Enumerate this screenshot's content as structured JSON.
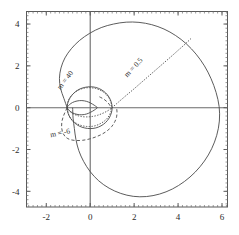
{
  "chart_data": {
    "type": "line",
    "title": "",
    "xlabel": "",
    "ylabel": "",
    "xlim": [
      -2.9,
      6.25
    ],
    "ylim": [
      -4.75,
      4.6
    ],
    "xticks": [
      -2,
      0,
      2,
      4,
      6
    ],
    "xticklabels": [
      "-2",
      "0",
      "2",
      "4",
      "6"
    ],
    "yticks": [
      4,
      2,
      0,
      -2,
      -4
    ],
    "yticklabels": [
      "4",
      "2",
      "0",
      "-2",
      "-4"
    ],
    "grid": false,
    "legend_position": "inline-annotations",
    "minor_ticks": true,
    "coordinate_system": "cartesian-render-of-polar-family",
    "annotations": [
      {
        "name": "label-m-40",
        "text": "m = 40",
        "x": -1.05,
        "y": 1.25,
        "rotation": -52,
        "linestyle": "dotted"
      },
      {
        "name": "label-m-05",
        "text": "m = 0.5",
        "x": 2.05,
        "y": 1.85,
        "rotation": -47,
        "linestyle": "dotted"
      },
      {
        "name": "label-m-neg6",
        "text": "m = -6",
        "x": -1.35,
        "y": -1.32,
        "rotation": -12,
        "linestyle": "dashed"
      }
    ],
    "series": [
      {
        "name": "outer-solid-curve",
        "linestyle": "solid",
        "description": "large limacon lobe reaching x=5.9 at y=0, top y=4.1, bottom y=-4.25, left cusp near x=-1.05",
        "points": [
          [
            -1.05,
            0.0
          ],
          [
            -1.2,
            0.45
          ],
          [
            -1.35,
            0.92
          ],
          [
            -1.4,
            1.4
          ],
          [
            -1.33,
            1.9
          ],
          [
            -1.15,
            2.38
          ],
          [
            -0.86,
            2.82
          ],
          [
            -0.48,
            3.22
          ],
          [
            -0.02,
            3.56
          ],
          [
            0.5,
            3.83
          ],
          [
            1.06,
            4.0
          ],
          [
            1.64,
            4.09
          ],
          [
            2.22,
            4.08
          ],
          [
            2.8,
            3.97
          ],
          [
            3.36,
            3.76
          ],
          [
            3.89,
            3.45
          ],
          [
            4.38,
            3.05
          ],
          [
            4.82,
            2.56
          ],
          [
            5.2,
            2.0
          ],
          [
            5.5,
            1.39
          ],
          [
            5.73,
            0.73
          ],
          [
            5.87,
            0.05
          ],
          [
            5.88,
            -0.64
          ],
          [
            5.76,
            -1.32
          ],
          [
            5.53,
            -1.96
          ],
          [
            5.2,
            -2.55
          ],
          [
            4.78,
            -3.08
          ],
          [
            4.29,
            -3.53
          ],
          [
            3.74,
            -3.89
          ],
          [
            3.16,
            -4.13
          ],
          [
            2.56,
            -4.25
          ],
          [
            1.96,
            -4.24
          ],
          [
            1.39,
            -4.1
          ],
          [
            0.86,
            -3.85
          ],
          [
            0.39,
            -3.5
          ],
          [
            0.0,
            -3.06
          ],
          [
            -0.3,
            -2.57
          ],
          [
            -0.52,
            -2.05
          ],
          [
            -0.65,
            -1.52
          ],
          [
            -0.72,
            -1.0
          ],
          [
            -0.78,
            -0.5
          ],
          [
            -0.8,
            0.0
          ]
        ]
      },
      {
        "name": "mid-solid-curve",
        "linestyle": "solid",
        "description": "medium oval through (1.0,0) and (-1.05,0), top y=1.0",
        "points": [
          [
            1.0,
            0.0
          ],
          [
            0.96,
            0.26
          ],
          [
            0.86,
            0.5
          ],
          [
            0.7,
            0.71
          ],
          [
            0.49,
            0.87
          ],
          [
            0.25,
            0.97
          ],
          [
            0.0,
            1.0
          ],
          [
            -0.25,
            0.97
          ],
          [
            -0.5,
            0.88
          ],
          [
            -0.72,
            0.72
          ],
          [
            -0.9,
            0.5
          ],
          [
            -1.01,
            0.26
          ],
          [
            -1.05,
            0.0
          ],
          [
            -1.01,
            -0.26
          ],
          [
            -0.9,
            -0.5
          ],
          [
            -0.72,
            -0.72
          ],
          [
            -0.5,
            -0.88
          ],
          [
            -0.25,
            -0.97
          ],
          [
            0.0,
            -1.0
          ],
          [
            0.25,
            -0.97
          ],
          [
            0.49,
            -0.87
          ],
          [
            0.7,
            -0.71
          ],
          [
            0.86,
            -0.5
          ],
          [
            0.96,
            -0.26
          ],
          [
            1.0,
            0.0
          ]
        ]
      },
      {
        "name": "inner-solid-loop",
        "linestyle": "solid",
        "description": "small cusp loop left of origin, from (-1.05,0) to (0.32,0)",
        "points": [
          [
            -1.05,
            0.0
          ],
          [
            -0.95,
            0.14
          ],
          [
            -0.8,
            0.25
          ],
          [
            -0.6,
            0.32
          ],
          [
            -0.38,
            0.34
          ],
          [
            -0.16,
            0.3
          ],
          [
            0.02,
            0.22
          ],
          [
            0.18,
            0.12
          ],
          [
            0.3,
            0.03
          ],
          [
            0.32,
            0.0
          ],
          [
            0.3,
            -0.03
          ],
          [
            0.18,
            -0.12
          ],
          [
            0.02,
            -0.22
          ],
          [
            -0.16,
            -0.3
          ],
          [
            -0.38,
            -0.34
          ],
          [
            -0.6,
            -0.32
          ],
          [
            -0.8,
            -0.25
          ],
          [
            -0.95,
            -0.14
          ],
          [
            -1.05,
            0.0
          ]
        ]
      },
      {
        "name": "m-0.5-dotted-curve",
        "linestyle": "dotted",
        "description": "dotted spiral arm sweeping from lower-left cusp outward to upper-right near (4.6,3.35)",
        "points": [
          [
            -1.05,
            0.0
          ],
          [
            -0.9,
            -0.2
          ],
          [
            -0.68,
            -0.34
          ],
          [
            -0.42,
            -0.42
          ],
          [
            -0.12,
            -0.44
          ],
          [
            0.2,
            -0.4
          ],
          [
            0.5,
            -0.3
          ],
          [
            0.76,
            -0.17
          ],
          [
            0.95,
            -0.04
          ],
          [
            1.05,
            0.05
          ],
          [
            1.3,
            0.28
          ],
          [
            1.62,
            0.57
          ],
          [
            1.95,
            0.86
          ],
          [
            2.3,
            1.18
          ],
          [
            2.65,
            1.5
          ],
          [
            3.0,
            1.82
          ],
          [
            3.35,
            2.14
          ],
          [
            3.7,
            2.46
          ],
          [
            4.02,
            2.76
          ],
          [
            4.32,
            3.04
          ],
          [
            4.58,
            3.3
          ]
        ]
      },
      {
        "name": "m-40-dotted-curve",
        "linestyle": "dotted",
        "description": "dotted oval slightly inside mid solid curve, upper-left portion prominent",
        "points": [
          [
            -1.05,
            0.0
          ],
          [
            -1.03,
            0.22
          ],
          [
            -0.95,
            0.44
          ],
          [
            -0.82,
            0.62
          ],
          [
            -0.64,
            0.78
          ],
          [
            -0.42,
            0.89
          ],
          [
            -0.18,
            0.95
          ],
          [
            0.06,
            0.95
          ],
          [
            0.3,
            0.9
          ],
          [
            0.52,
            0.8
          ],
          [
            0.71,
            0.65
          ],
          [
            0.85,
            0.47
          ],
          [
            0.94,
            0.27
          ],
          [
            0.97,
            0.05
          ],
          [
            0.94,
            -0.18
          ],
          [
            0.85,
            -0.4
          ],
          [
            0.7,
            -0.59
          ],
          [
            0.5,
            -0.74
          ],
          [
            0.27,
            -0.85
          ],
          [
            0.02,
            -0.9
          ],
          [
            -0.23,
            -0.89
          ],
          [
            -0.47,
            -0.83
          ],
          [
            -0.68,
            -0.71
          ],
          [
            -0.86,
            -0.55
          ],
          [
            -0.98,
            -0.33
          ],
          [
            -1.04,
            -0.1
          ],
          [
            -1.05,
            0.0
          ]
        ]
      },
      {
        "name": "m-neg6-dashed-curve",
        "linestyle": "dashed",
        "description": "dashed lobe dipping below axis, from cusp (-1.05,0) down to y=-1.55 and back up to (1.0,0)",
        "points": [
          [
            -1.05,
            0.0
          ],
          [
            -1.18,
            -0.3
          ],
          [
            -1.28,
            -0.62
          ],
          [
            -1.3,
            -0.94
          ],
          [
            -1.24,
            -1.22
          ],
          [
            -1.1,
            -1.42
          ],
          [
            -0.9,
            -1.53
          ],
          [
            -0.64,
            -1.57
          ],
          [
            -0.35,
            -1.56
          ],
          [
            -0.05,
            -1.5
          ],
          [
            0.25,
            -1.4
          ],
          [
            0.53,
            -1.27
          ],
          [
            0.78,
            -1.1
          ],
          [
            0.98,
            -0.9
          ],
          [
            1.12,
            -0.67
          ],
          [
            1.2,
            -0.44
          ],
          [
            1.22,
            -0.2
          ],
          [
            1.2,
            0.0
          ]
        ]
      },
      {
        "name": "m-neg6-dashed-upper-arc",
        "linestyle": "dashed",
        "description": "short dashed arc in upper right of central region",
        "points": [
          [
            0.42,
            0.52
          ],
          [
            0.6,
            0.42
          ],
          [
            0.76,
            0.29
          ],
          [
            0.88,
            0.14
          ],
          [
            0.94,
            0.0
          ]
        ]
      }
    ]
  }
}
